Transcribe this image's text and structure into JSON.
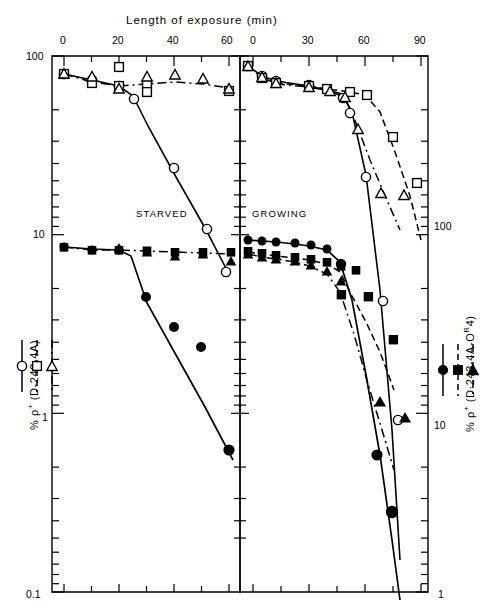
{
  "figure": {
    "top_axis_title": "Length of exposure (min)",
    "left_axis_title_html": "% &rho;<sup>+</sup>  (D-243-4A)",
    "right_axis_title_html": "% &rho;<sup>+</sup>  (D&middot;243-4A-O<sup>R</sup>4)",
    "panel_left_label": "STARVED",
    "panel_right_label": "GROWING"
  },
  "legends": {
    "left": {
      "entries": [
        {
          "symbol": "open-circle",
          "line": "solid"
        },
        {
          "symbol": "open-square",
          "line": "dashed"
        },
        {
          "symbol": "open-triangle",
          "line": "dash-dot"
        }
      ]
    },
    "right": {
      "entries": [
        {
          "symbol": "filled-circle",
          "line": "solid"
        },
        {
          "symbol": "filled-square",
          "line": "dashed"
        },
        {
          "symbol": "filled-triangle",
          "line": "dash-dot"
        }
      ]
    }
  },
  "axes": {
    "left_y_labels": [
      "100",
      "10",
      "1",
      "0.1"
    ],
    "right_y_labels": [
      "100",
      "10",
      "1"
    ],
    "left_x_labels": [
      "0",
      "20",
      "40",
      "60"
    ],
    "right_x_labels": [
      "0",
      "30",
      "60",
      "90"
    ]
  },
  "chart_data": {
    "type": "scatter",
    "title": "Length of exposure (min)",
    "xlabel": "Length of exposure (min)",
    "ylabel": "% ρ+ (D-243-4A)",
    "ylabel_right": "% ρ+ (D·243-4A-O^R4)",
    "yscale": "log",
    "grid": false,
    "legend_position": "left-outside and right-outside",
    "panels": [
      {
        "name": "STARVED",
        "xlim": [
          0,
          68
        ],
        "xticks_major": [
          0,
          20,
          40,
          60
        ],
        "xticks_minor": [
          10,
          30,
          50
        ],
        "y_left_lim": [
          0.1,
          100
        ],
        "y_left_ticks": [
          100,
          10,
          1,
          0.1
        ],
        "y_right_lim": [
          1,
          100
        ],
        "y_right_ticks": [
          100,
          10,
          1
        ],
        "series": [
          {
            "name": "open-circle (D-243-4A)",
            "symbol": "open-circle",
            "line": "solid",
            "axis": "left",
            "points": [
              [
                0,
                78
              ],
              [
                10,
                72
              ],
              [
                20,
                64
              ],
              [
                30,
                56
              ],
              [
                32,
                44
              ],
              [
                45,
                14
              ],
              [
                55,
                5.2
              ],
              [
                62,
                2.6
              ]
            ]
          },
          {
            "name": "open-square (D-243-4A)",
            "symbol": "open-square",
            "line": "dashed",
            "axis": "left",
            "points": [
              [
                0,
                78
              ],
              [
                10,
                66
              ],
              [
                20,
                86
              ],
              [
                20,
                64
              ],
              [
                30,
                68
              ],
              [
                40,
                65
              ],
              [
                62,
                61
              ]
            ]
          },
          {
            "name": "open-triangle (D-243-4A)",
            "symbol": "open-triangle",
            "line": "dash-dot",
            "axis": "left",
            "points": [
              [
                0,
                80
              ],
              [
                10,
                76
              ],
              [
                20,
                63
              ],
              [
                30,
                70
              ],
              [
                40,
                76
              ],
              [
                50,
                72
              ],
              [
                62,
                62
              ]
            ]
          },
          {
            "name": "filled-circle (D-243-4A-O R4)",
            "symbol": "filled-circle",
            "line": "solid",
            "axis": "right",
            "points": [
              [
                0,
                8.6
              ],
              [
                10,
                8.3
              ],
              [
                20,
                8.4
              ],
              [
                32,
                3.4
              ],
              [
                42,
                2.35
              ],
              [
                52,
                1.9
              ],
              [
                62,
                0.55
              ]
            ]
          },
          {
            "name": "filled-square (D-243-4A-O R4)",
            "symbol": "filled-square",
            "line": "dashed",
            "axis": "right",
            "points": [
              [
                0,
                8.6
              ],
              [
                10,
                8.2
              ],
              [
                20,
                8.4
              ],
              [
                30,
                8.3
              ],
              [
                40,
                8.2
              ],
              [
                50,
                8.0
              ],
              [
                62,
                8.0
              ]
            ]
          },
          {
            "name": "filled-triangle (D-243-4A-O R4)",
            "symbol": "filled-triangle",
            "line": "dash-dot",
            "axis": "right",
            "points": [
              [
                0,
                8.5
              ],
              [
                20,
                8.5
              ],
              [
                30,
                8.1
              ],
              [
                40,
                7.7
              ],
              [
                50,
                7.9
              ],
              [
                62,
                7.0
              ]
            ]
          }
        ]
      },
      {
        "name": "GROWING",
        "xlim": [
          0,
          105
        ],
        "xticks_major": [
          0,
          30,
          60,
          90
        ],
        "xticks_minor": [
          15,
          45,
          75,
          105
        ],
        "y_left_lim": [
          0.1,
          100
        ],
        "y_right_lim": [
          1,
          100
        ],
        "series": [
          {
            "name": "open-circle (D-243-4A)",
            "symbol": "open-circle",
            "line": "solid",
            "axis": "left",
            "points": [
              [
                0,
                86
              ],
              [
                8,
                76
              ],
              [
                16,
                72
              ],
              [
                30,
                68
              ],
              [
                40,
                64
              ],
              [
                48,
                60
              ],
              [
                52,
                52
              ],
              [
                72,
                22
              ],
              [
                88,
                9.8
              ]
            ]
          },
          {
            "name": "open-square (D-243-4A)",
            "symbol": "open-square",
            "line": "dashed",
            "axis": "left",
            "points": [
              [
                0,
                86
              ],
              [
                8,
                74
              ],
              [
                16,
                70
              ],
              [
                30,
                68
              ],
              [
                40,
                66
              ],
              [
                52,
                64
              ],
              [
                60,
                62
              ],
              [
                75,
                44
              ],
              [
                88,
                26
              ]
            ]
          },
          {
            "name": "open-triangle (D-243-4A)",
            "symbol": "open-triangle",
            "line": "dash-dot",
            "axis": "left",
            "points": [
              [
                0,
                84
              ],
              [
                16,
                70
              ],
              [
                40,
                64
              ],
              [
                50,
                60
              ],
              [
                56,
                52
              ],
              [
                70,
                29
              ],
              [
                85,
                27
              ]
            ]
          },
          {
            "name": "filled-circle (D-243-4A-O R4)",
            "symbol": "filled-circle",
            "line": "solid",
            "axis": "right",
            "points": [
              [
                0,
                82
              ],
              [
                8,
                82
              ],
              [
                16,
                80
              ],
              [
                30,
                78
              ],
              [
                40,
                76
              ],
              [
                48,
                70
              ],
              [
                52,
                46
              ],
              [
                72,
                6.0
              ],
              [
                88,
                2.8
              ]
            ]
          },
          {
            "name": "filled-square (D-243-4A-O R4)",
            "symbol": "filled-square",
            "line": "dashed",
            "axis": "right",
            "points": [
              [
                0,
                70
              ],
              [
                8,
                68
              ],
              [
                16,
                66
              ],
              [
                30,
                64
              ],
              [
                40,
                62
              ],
              [
                50,
                60
              ],
              [
                56,
                58
              ],
              [
                62,
                45
              ],
              [
                72,
                44
              ],
              [
                80,
                26
              ]
            ]
          },
          {
            "name": "filled-triangle (D-243-4A-O R4)",
            "symbol": "filled-triangle",
            "line": "dash-dot",
            "axis": "right",
            "points": [
              [
                0,
                68
              ],
              [
                8,
                64
              ],
              [
                16,
                62
              ],
              [
                30,
                58
              ],
              [
                42,
                52
              ],
              [
                50,
                46
              ],
              [
                62,
                14
              ],
              [
                72,
                12
              ]
            ]
          }
        ]
      }
    ]
  }
}
